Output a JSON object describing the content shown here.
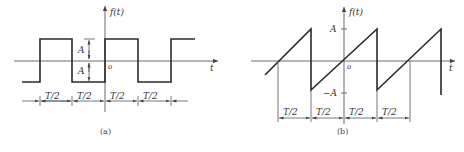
{
  "figure_a": {
    "caption": "(a)",
    "y_label": "f(t)",
    "x_label": "t",
    "origin_label": "o",
    "amplitude_upper_label": "A",
    "amplitude_lower_label": "A",
    "waveform": "square",
    "dimension_labels": [
      "T/2",
      "T/2",
      "T/2",
      "T/2"
    ]
  },
  "figure_b": {
    "caption": "(b)",
    "y_label": "f(t)",
    "x_label": "t",
    "origin_label": "o",
    "y_tick_upper": "A",
    "y_tick_lower": "−A",
    "waveform": "sawtooth",
    "dimension_labels": [
      "T/2",
      "T/2",
      "T/2",
      "T/2"
    ]
  },
  "colors": {
    "background": "#ffffff",
    "stroke": "#2a2a2a",
    "axis": "#6a6a6a"
  }
}
